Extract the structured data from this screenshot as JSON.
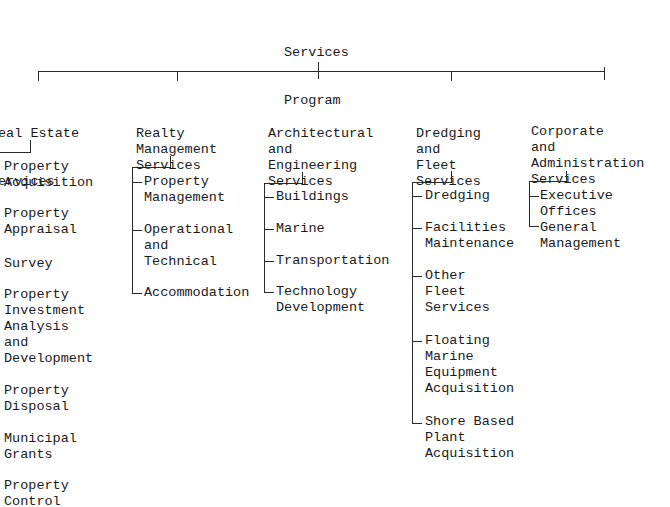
{
  "root": {
    "line1": "Services",
    "line2": "Program"
  },
  "branches": [
    {
      "title": [
        "eal Estate",
        "ervices"
      ],
      "items": [
        [
          "Property",
          "Acquisition"
        ],
        [
          "Property",
          "Appraisal"
        ],
        [
          "Survey"
        ],
        [
          "Property",
          "Investment",
          "Analysis",
          "and",
          "Development"
        ],
        [
          "Property",
          "Disposal"
        ],
        [
          "Municipal",
          "Grants"
        ],
        [
          "Property",
          "Control"
        ]
      ]
    },
    {
      "title": [
        "Realty",
        "Management",
        "Services"
      ],
      "items": [
        [
          "Property",
          "Management"
        ],
        [
          "Operational",
          "and",
          "Technical"
        ],
        [
          "Accommodation"
        ]
      ]
    },
    {
      "title": [
        "Architectural",
        "and",
        "Engineering",
        "Services"
      ],
      "items": [
        [
          "Buildings"
        ],
        [
          "Marine"
        ],
        [
          "Transportation"
        ],
        [
          "Technology",
          "Development"
        ]
      ]
    },
    {
      "title": [
        "Dredging",
        "and",
        "Fleet",
        "Services"
      ],
      "items": [
        [
          "Dredging"
        ],
        [
          "Facilities",
          "Maintenance"
        ],
        [
          "Other",
          "Fleet",
          "Services"
        ],
        [
          "Floating",
          "Marine",
          "Equipment",
          "Acquisition"
        ],
        [
          "Shore Based",
          "Plant",
          "Acquisition"
        ]
      ]
    },
    {
      "title": [
        "Corporate",
        "and",
        "Administration",
        "Services"
      ],
      "items": [
        [
          "Executive",
          "Offices"
        ],
        [
          "General",
          "Management"
        ]
      ]
    }
  ]
}
